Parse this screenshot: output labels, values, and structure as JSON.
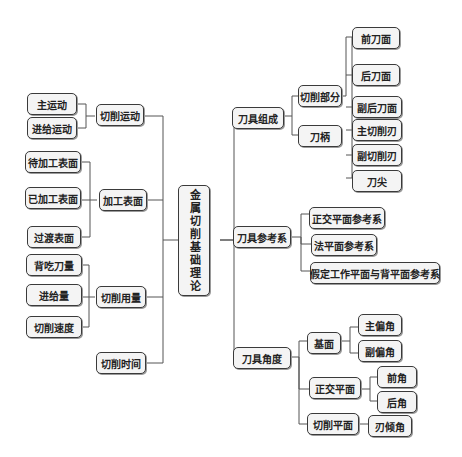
{
  "root": {
    "label": "金属切削基础理论"
  },
  "left": {
    "cutting_motion": {
      "label": "切削运动",
      "children": [
        "主运动",
        "进给运动"
      ]
    },
    "machined_surface": {
      "label": "加工表面",
      "children": [
        "待加工表面",
        "已加工表面",
        "过渡表面"
      ]
    },
    "cutting_amount": {
      "label": "切削用量",
      "children": [
        "背吃刀量",
        "进给量",
        "切削速度"
      ]
    },
    "cutting_time": {
      "label": "切削时间"
    }
  },
  "right": {
    "tool_composition": {
      "label": "刀具组成",
      "cutting_part": {
        "label": "切削部分",
        "children": [
          "前刀面",
          "后刀面",
          "副后刀面",
          "主切削刃",
          "副切削刃",
          "刀尖"
        ]
      },
      "shank": {
        "label": "刀柄"
      }
    },
    "tool_reference": {
      "label": "刀具参考系",
      "children": [
        "正交平面参考系",
        "法平面参考系",
        "假定工作平面与背平面参考系"
      ]
    },
    "tool_angle": {
      "label": "刀具角度",
      "base_plane": {
        "label": "基面",
        "children": [
          "主偏角",
          "副偏角"
        ]
      },
      "orthogonal_plane": {
        "label": "正交平面",
        "children": [
          "前角",
          "后角"
        ]
      },
      "cutting_plane": {
        "label": "切削平面",
        "children": [
          "刃倾角"
        ]
      }
    }
  },
  "colors": {
    "border": "#3a3a3a",
    "fill": "#f4f4f4",
    "line": "#555555"
  }
}
